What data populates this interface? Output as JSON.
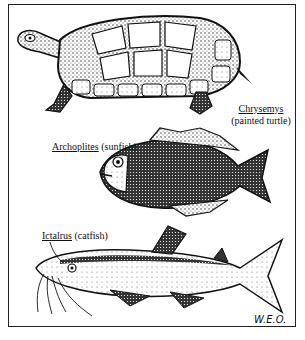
{
  "illustration": {
    "artist_signature": "W.E.O.",
    "specimens": [
      {
        "id": "turtle",
        "genus": "Chrysemys",
        "common_name": "(painted turtle)"
      },
      {
        "id": "sunfish",
        "genus": "Archoplites",
        "common_name": "(sunfish)"
      },
      {
        "id": "catfish",
        "genus": "Ictalrus",
        "common_name": "(catfish)"
      }
    ]
  }
}
